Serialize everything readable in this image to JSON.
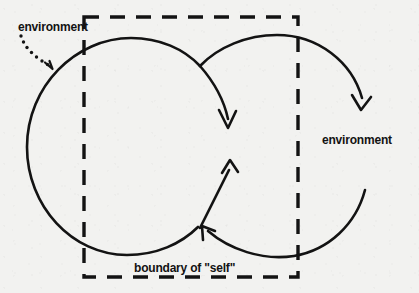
{
  "figure": {
    "background_color": "#f2f2f0",
    "ink_color": "#131313",
    "width": 419,
    "height": 293
  },
  "labels": {
    "environment_left": "environment",
    "environment_right": "environment",
    "boundary_self": "boundary of \"self\""
  },
  "boundary": {
    "name": "boundary of \"self\"",
    "shape": "dashed-rectangle",
    "x": 84,
    "y": 17,
    "width": 214,
    "height": 260,
    "dash": "14 11",
    "stroke_width": 3.4,
    "color": "#131313"
  },
  "arcs": [
    {
      "name": "left-loop",
      "description": "large open circle on the left crossing the boundary, arrow sweeps inward and down",
      "center_x": 122,
      "center_y": 147,
      "radius": 96,
      "arrowhead": "down",
      "arrow_tip_x": 228,
      "arrow_tip_y": 127
    },
    {
      "name": "right-loop",
      "description": "large open circle on the right crossing the boundary, arrow sweeps outward and down",
      "center_x": 288,
      "center_y": 160,
      "radius": 92,
      "arrowhead": "down-right",
      "arrow_tip_x": 360,
      "arrow_tip_y": 108
    },
    {
      "name": "inner-return-up",
      "description": "short curve rising with arrowhead pointing up",
      "arrow_tip_x": 230,
      "arrow_tip_y": 160
    },
    {
      "name": "inner-return-left",
      "description": "curve from the right sweeping left with arrowhead pointing up-left",
      "arrow_tip_x": 203,
      "arrow_tip_y": 228
    }
  ],
  "pointer": {
    "name": "environment-pointer",
    "style": "dotted-curved-arrow",
    "from_x": 22,
    "from_y": 37,
    "to_x": 49,
    "to_y": 69,
    "dot_radius": 1.7,
    "color": "#131313"
  }
}
